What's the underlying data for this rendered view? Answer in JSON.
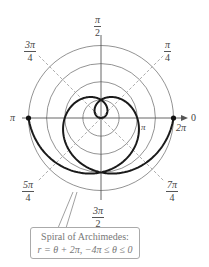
{
  "chart_data": {
    "type": "polar",
    "title": "Spiral of Archimedes",
    "equation": "r = θ + 2π, −4π ≤ θ ≤ 0",
    "theta_range": [
      -12.566,
      0
    ],
    "r_function": "theta + 2*pi",
    "rings_r": [
      1.5708,
      3.1416,
      4.7124,
      6.2832
    ],
    "angle_labels": [
      {
        "angle": "0",
        "num": "0",
        "den": ""
      },
      {
        "angle": "π/4",
        "num": "π",
        "den": "4"
      },
      {
        "angle": "π/2",
        "num": "π",
        "den": "2"
      },
      {
        "angle": "3π/4",
        "num": "3π",
        "den": "4"
      },
      {
        "angle": "π",
        "num": "π",
        "den": ""
      },
      {
        "angle": "5π/4",
        "num": "5π",
        "den": "4"
      },
      {
        "angle": "3π/2",
        "num": "3π",
        "den": "2"
      },
      {
        "angle": "7π/4",
        "num": "7π",
        "den": "4"
      }
    ],
    "axis_tick_labels": [
      {
        "text": "π",
        "position": "r = π on polar axis"
      },
      {
        "text": "2π",
        "position": "r = 2π on polar axis"
      }
    ],
    "marked_points": [
      {
        "r": 6.2832,
        "theta_deg": 0
      },
      {
        "r": 6.2832,
        "theta_deg": 180
      }
    ]
  },
  "labels": {
    "pi_over_2": {
      "num": "π",
      "den": "2"
    },
    "pi_over_4": {
      "num": "π",
      "den": "4"
    },
    "three_pi_over_4": {
      "num": "3π",
      "den": "4"
    },
    "five_pi_over_4": {
      "num": "5π",
      "den": "4"
    },
    "three_pi_over_2": {
      "num": "3π",
      "den": "2"
    },
    "seven_pi_over_4": {
      "num": "7π",
      "den": "4"
    },
    "pi_left": "π",
    "zero": "0",
    "pi_axis": "π",
    "two_pi": "2π"
  },
  "callout": {
    "title": "Spiral of Archimedes:",
    "equation": "r = θ + 2π, −4π ≤ θ ≤ 0"
  }
}
